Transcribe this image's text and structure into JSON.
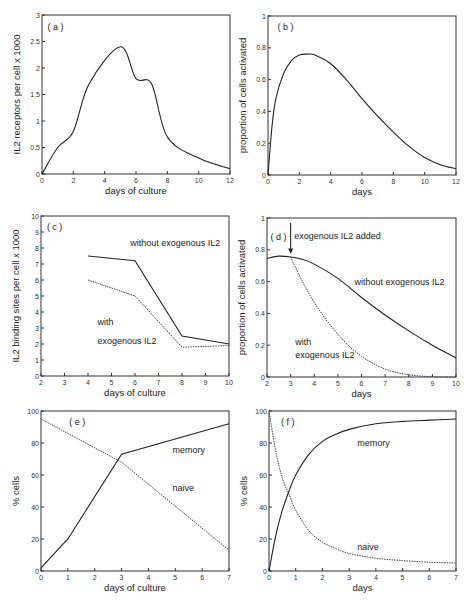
{
  "chart_data": [
    {
      "id": "a",
      "type": "line",
      "panel_label": "( a )",
      "title": "",
      "xlabel": "days of culture",
      "ylabel": "IL2 receptors per cell x 1000",
      "xlim": [
        0,
        12
      ],
      "ylim": [
        0,
        3
      ],
      "xticks": [
        "0",
        "2",
        "4",
        "6",
        "8",
        "10",
        "12"
      ],
      "yticks": [
        "0",
        "0.5",
        "1",
        "1.5",
        "2",
        "2.5",
        "3"
      ],
      "grid": false,
      "series": [
        {
          "name": "IL2 receptors",
          "style": "solid",
          "x": [
            0,
            1,
            2,
            3,
            5,
            6,
            7,
            8,
            10,
            12
          ],
          "y": [
            0,
            0.5,
            0.8,
            1.7,
            2.4,
            1.8,
            1.7,
            0.7,
            0.3,
            0.1
          ]
        }
      ]
    },
    {
      "id": "b",
      "type": "line",
      "panel_label": "( b )",
      "title": "",
      "xlabel": "days",
      "ylabel": "proportion of cells activated",
      "xlim": [
        0,
        12
      ],
      "ylim": [
        0,
        1
      ],
      "xticks": [
        "0",
        "2",
        "4",
        "6",
        "8",
        "10",
        "12"
      ],
      "yticks": [
        "0",
        "0.2",
        "0.4",
        "0.6",
        "0.8",
        "1"
      ],
      "grid": false,
      "series": [
        {
          "name": "proportion activated",
          "style": "solid",
          "x": [
            0,
            0.25,
            0.5,
            1,
            1.5,
            2,
            2.5,
            3,
            4,
            5,
            6,
            7,
            8,
            9,
            10,
            11,
            12
          ],
          "y": [
            0,
            0.3,
            0.48,
            0.64,
            0.72,
            0.755,
            0.76,
            0.755,
            0.7,
            0.6,
            0.48,
            0.37,
            0.27,
            0.18,
            0.11,
            0.065,
            0.04
          ]
        }
      ]
    },
    {
      "id": "c",
      "type": "line",
      "panel_label": "( c )",
      "title": "",
      "xlabel": "days of culture",
      "ylabel": "IL2 binding sites per cell x 1000",
      "xlim": [
        2,
        10
      ],
      "ylim": [
        0,
        10
      ],
      "xticks": [
        "2",
        "3",
        "4",
        "5",
        "6",
        "7",
        "8",
        "9",
        "10"
      ],
      "yticks": [
        "0",
        "1",
        "2",
        "3",
        "4",
        "5",
        "6",
        "7",
        "8",
        "9",
        "10"
      ],
      "grid": false,
      "annotations": [
        "without exogenous IL2",
        "with",
        "exogenous IL2"
      ],
      "series": [
        {
          "name": "without exogenous IL2",
          "style": "solid",
          "x": [
            4,
            6,
            8,
            10
          ],
          "y": [
            7.5,
            7.2,
            2.5,
            2.0
          ]
        },
        {
          "name": "with exogenous IL2",
          "style": "dotted",
          "x": [
            4,
            6,
            8,
            10
          ],
          "y": [
            6.0,
            5.0,
            1.8,
            1.9
          ]
        }
      ]
    },
    {
      "id": "d",
      "type": "line",
      "panel_label": "( d )",
      "title": "",
      "xlabel": "days",
      "ylabel": "proportion of cells activated",
      "xlim": [
        2,
        10
      ],
      "ylim": [
        0,
        1
      ],
      "xticks": [
        "2",
        "3",
        "4",
        "5",
        "6",
        "7",
        "8",
        "9",
        "10"
      ],
      "yticks": [
        "0",
        "0.2",
        "0.4",
        "0.6",
        "0.8",
        "1"
      ],
      "grid": false,
      "annotations": [
        "exogenous IL2 added",
        "without exogenous IL2",
        "with",
        "exogenous IL2"
      ],
      "arrow_at_x": 3,
      "series": [
        {
          "name": "without exogenous IL2",
          "style": "solid",
          "x": [
            2,
            2.5,
            3,
            3.5,
            4,
            5,
            6,
            7,
            8,
            9,
            10
          ],
          "y": [
            0.745,
            0.76,
            0.755,
            0.74,
            0.71,
            0.62,
            0.5,
            0.39,
            0.29,
            0.2,
            0.12
          ]
        },
        {
          "name": "with exogenous IL2",
          "style": "dotted",
          "x": [
            3,
            3.5,
            4,
            4.5,
            5,
            5.5,
            6,
            6.5,
            7,
            7.5,
            8,
            8.5,
            9,
            9.5,
            10
          ],
          "y": [
            0.755,
            0.6,
            0.47,
            0.36,
            0.27,
            0.19,
            0.13,
            0.085,
            0.05,
            0.028,
            0.014,
            0.006,
            0.002,
            0.0,
            0.0
          ]
        }
      ]
    },
    {
      "id": "e",
      "type": "line",
      "panel_label": "( e )",
      "title": "",
      "xlabel": "days of culture",
      "ylabel": "% cells",
      "xlim": [
        0,
        7
      ],
      "ylim": [
        0,
        100
      ],
      "xticks": [
        "0",
        "1",
        "2",
        "3",
        "4",
        "5",
        "6",
        "7"
      ],
      "yticks": [
        "0",
        "20",
        "40",
        "60",
        "80",
        "100"
      ],
      "grid": false,
      "annotations": [
        "memory",
        "naive"
      ],
      "series": [
        {
          "name": "memory",
          "style": "solid",
          "x": [
            0,
            1,
            3,
            7
          ],
          "y": [
            2,
            20,
            73,
            92
          ]
        },
        {
          "name": "naive",
          "style": "dotted",
          "x": [
            0,
            3,
            7
          ],
          "y": [
            95,
            68,
            13
          ]
        }
      ]
    },
    {
      "id": "f",
      "type": "line",
      "panel_label": "( f )",
      "title": "",
      "xlabel": "days",
      "ylabel": "% cells",
      "xlim": [
        0,
        7
      ],
      "ylim": [
        0,
        100
      ],
      "xticks": [
        "0",
        "1",
        "2",
        "3",
        "4",
        "5",
        "6",
        "7"
      ],
      "yticks": [
        "0",
        "20",
        "40",
        "60",
        "80",
        "100"
      ],
      "grid": false,
      "annotations": [
        "memory",
        "naive"
      ],
      "series": [
        {
          "name": "memory",
          "style": "solid",
          "x": [
            0,
            0.25,
            0.5,
            0.75,
            1,
            1.5,
            2,
            2.5,
            3,
            4,
            5,
            6,
            7
          ],
          "y": [
            0,
            22,
            38,
            50,
            60,
            73,
            81,
            85.5,
            88.5,
            92,
            93.5,
            94.3,
            95
          ]
        },
        {
          "name": "naive",
          "style": "dotted",
          "x": [
            0,
            0.25,
            0.5,
            0.75,
            1,
            1.5,
            2,
            2.5,
            3,
            4,
            5,
            6,
            7
          ],
          "y": [
            100,
            75,
            58,
            48,
            38,
            25,
            18,
            14,
            11,
            8,
            6.5,
            5.5,
            5
          ]
        }
      ]
    }
  ]
}
